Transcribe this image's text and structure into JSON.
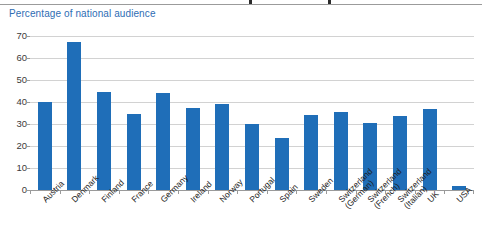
{
  "chart_title": "Percentage of national audience",
  "colors": {
    "bar": "#1f6eb8",
    "title": "#2e6db4",
    "grid": "#d2d2d2",
    "axis": "#9a9a9a",
    "tick_text": "#3a3a3a",
    "label_text": "#1c1c1c",
    "background": "#ffffff"
  },
  "chart_data": {
    "type": "bar",
    "title": "Percentage of national audience",
    "xlabel": "",
    "ylabel": "",
    "ylim": [
      0,
      70
    ],
    "yticks": [
      0,
      10,
      20,
      30,
      40,
      50,
      60,
      70
    ],
    "grid": true,
    "legend": "none",
    "categories": [
      "Austria",
      "Denmark",
      "Finland",
      "France",
      "Germany",
      "Ireland",
      "Norway",
      "Portugal",
      "Spain",
      "Sweden",
      "Switzerland (German)",
      "Switzerland (French)",
      "Switzerland (Italian)",
      "UK",
      "USA"
    ],
    "category_lines": [
      [
        "Austria"
      ],
      [
        "Denmark"
      ],
      [
        "Finland"
      ],
      [
        "France"
      ],
      [
        "Germany"
      ],
      [
        "Ireland"
      ],
      [
        "Norway"
      ],
      [
        "Portugal"
      ],
      [
        "Spain"
      ],
      [
        "Sweden"
      ],
      [
        "Switzerland",
        "(German)"
      ],
      [
        "Switzerland",
        "(French)"
      ],
      [
        "Switzerland",
        "(Italian)"
      ],
      [
        "UK"
      ],
      [
        "USA"
      ]
    ],
    "values": [
      40,
      67.5,
      44.5,
      34.5,
      44,
      37.5,
      39,
      30,
      23.5,
      34,
      35.5,
      30.5,
      33.5,
      37,
      2
    ]
  }
}
